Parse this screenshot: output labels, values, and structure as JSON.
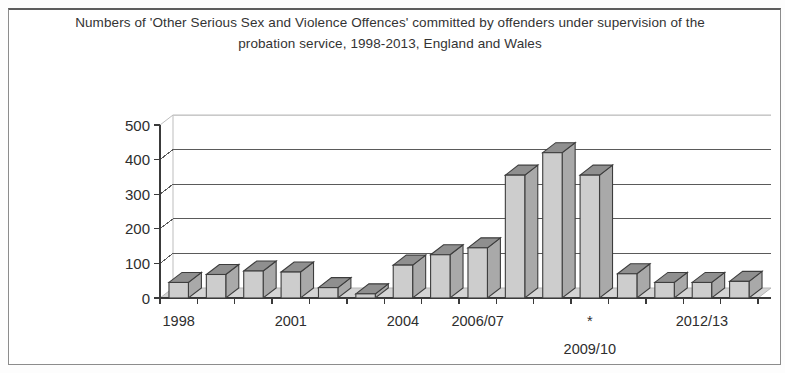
{
  "document": {
    "frame_border_color": "#8c8c8c",
    "background_color": "#ffffff"
  },
  "chart_data": {
    "type": "bar",
    "title": "Numbers of 'Other Serious Sex and Violence Offences' committed by offenders under supervision of the probation service, 1998-2013, England and Wales",
    "xlabel": "",
    "ylabel": "",
    "ylim": [
      0,
      500
    ],
    "yticks": [
      0,
      100,
      200,
      300,
      400,
      500
    ],
    "ytick_labels": [
      "0",
      "100",
      "200",
      "300",
      "400",
      "500"
    ],
    "grid": true,
    "legend": "none",
    "style": "3d-column",
    "bar_fill_color": "#cdcdcd",
    "bar_outline_color": "#3d3d3d",
    "floor_color": "#d4d4d4",
    "categories": [
      "1998",
      "1999",
      "2000",
      "2001",
      "2002",
      "2003",
      "2004",
      "2005",
      "2006/07",
      "2007/08",
      "2008/09",
      "2009/10",
      "2010/11",
      "2011/12",
      "2012/13",
      "2013/14"
    ],
    "values": [
      45,
      68,
      78,
      75,
      30,
      12,
      95,
      125,
      145,
      355,
      420,
      355,
      70,
      45,
      45,
      48
    ],
    "visible_xtick_labels": [
      {
        "label": "1998",
        "index": 0,
        "row": 1
      },
      {
        "label": "2001",
        "index": 3,
        "row": 1
      },
      {
        "label": "2004",
        "index": 6,
        "row": 1
      },
      {
        "label": "2006/07",
        "index": 8,
        "row": 1
      },
      {
        "label": "*",
        "index": 11,
        "row": 1
      },
      {
        "label": "2009/10",
        "index": 11,
        "row": 2
      },
      {
        "label": "2012/13",
        "index": 14,
        "row": 1
      }
    ],
    "annotations": [
      {
        "text": "*",
        "meaning": "marker above 2009/10 category label"
      }
    ]
  },
  "axis": {
    "y_tick_labels": [
      "500",
      "400",
      "300",
      "200",
      "100",
      "0"
    ],
    "x_tick_labels_row1": [
      "1998",
      "2001",
      "2004",
      "2006/07",
      "*",
      "2012/13"
    ],
    "x_tick_labels_row2": [
      "2009/10"
    ]
  }
}
